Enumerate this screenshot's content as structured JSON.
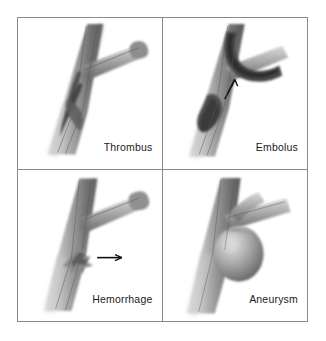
{
  "figure": {
    "background_color": "#ffffff",
    "border_color": "#8a8a8e",
    "label_color": "#1b1b1b"
  },
  "panels": [
    {
      "id": "thrombus",
      "label": "Thrombus",
      "row": 0,
      "col": 0,
      "vessel": "artery bifurcation",
      "finding": "dark elongated clot adherent within the lumen of the main vessel",
      "has_arrow": false
    },
    {
      "id": "embolus",
      "label": "Embolus",
      "row": 0,
      "col": 1,
      "vessel": "artery bifurcation",
      "finding": "free-floating clot in the lower lumen with a second mass lodged at the branch point",
      "has_arrow": true,
      "arrow_direction": "up-left",
      "arrow_meaning": "direction of embolus travel"
    },
    {
      "id": "hemorrhage",
      "label": "Hemorrhage",
      "row": 1,
      "col": 0,
      "vessel": "artery bifurcation",
      "finding": "jagged rupture in the vessel wall below the branch point with blood escaping",
      "has_arrow": true,
      "arrow_direction": "right",
      "arrow_meaning": "direction of blood escaping the vessel"
    },
    {
      "id": "aneurysm",
      "label": "Aneurysm",
      "row": 1,
      "col": 1,
      "vessel": "artery bifurcation",
      "finding": "rounded saccular outpouching of the vessel wall at the bifurcation",
      "has_arrow": false
    }
  ],
  "palette": {
    "vessel_light": "#d8d8d8",
    "vessel_mid": "#a5a5a5",
    "vessel_dark": "#6d6d6d",
    "vessel_shadow": "#4a4a4a",
    "clot_dark": "#3a3a3a",
    "arrow": "#111111"
  }
}
